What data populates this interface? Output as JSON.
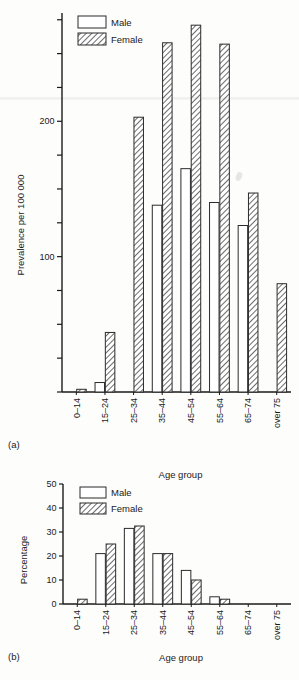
{
  "figure": {
    "panel_a_label": "(a)",
    "panel_b_label": "(b)"
  },
  "chart_data": [
    {
      "type": "bar",
      "panel": "(a)",
      "title": "",
      "xlabel": "Age group",
      "ylabel": "Prevalence per 100 000",
      "categories": [
        "0–14",
        "15–24",
        "25–34",
        "35–44",
        "45–54",
        "55–64",
        "65–74",
        "over 75"
      ],
      "series": [
        {
          "name": "Male",
          "values": [
            0,
            7,
            0,
            138,
            165,
            140,
            123,
            0
          ]
        },
        {
          "name": "Female",
          "values": [
            2,
            44,
            203,
            258,
            271,
            257,
            147,
            80
          ]
        }
      ],
      "ylim": [
        0,
        280
      ],
      "yticks": [
        0,
        25,
        50,
        75,
        100,
        125,
        150,
        175,
        200,
        225,
        250,
        275
      ],
      "ytick_labels": [
        "",
        "",
        "",
        "",
        "100",
        "",
        "",
        "",
        "200",
        "",
        "",
        ""
      ],
      "grid": false,
      "legend": [
        "Male",
        "Female"
      ],
      "legend_position": "top-left"
    },
    {
      "type": "bar",
      "panel": "(b)",
      "title": "",
      "xlabel": "Age group",
      "ylabel": "Percentage",
      "categories": [
        "0–14",
        "15–24",
        "25–34",
        "35–44",
        "45–54",
        "55–64",
        "65–74",
        "over 75"
      ],
      "series": [
        {
          "name": "Male",
          "values": [
            0,
            21,
            31.5,
            21,
            14,
            3,
            0,
            0
          ]
        },
        {
          "name": "Female",
          "values": [
            2,
            25,
            32.5,
            21,
            10,
            2,
            0,
            0
          ]
        }
      ],
      "ylim": [
        0,
        50
      ],
      "yticks": [
        0,
        10,
        20,
        30,
        40,
        50
      ],
      "ytick_labels": [
        "0",
        "10",
        "20",
        "30",
        "40",
        "50"
      ],
      "grid": false,
      "legend": [
        "Male",
        "Female"
      ],
      "legend_position": "top-left"
    }
  ]
}
